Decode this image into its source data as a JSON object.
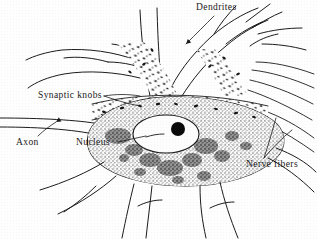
{
  "figure": {
    "background_color": "#fefefe",
    "ink_color": "#1a1a1a"
  },
  "labels": [
    {
      "id": "dendrites",
      "text": "Dendrites",
      "x": 196,
      "y": 3,
      "leader": "down-left to dendrite branches"
    },
    {
      "id": "synaptic_knobs",
      "text": "Synaptic knobs",
      "x": 38,
      "y": 91,
      "leader": "right to knob cluster"
    },
    {
      "id": "axon",
      "text": "Axon",
      "x": 16,
      "y": 138,
      "leader": "up-right to axon tube"
    },
    {
      "id": "nucleus",
      "text": "Nucleus",
      "x": 76,
      "y": 138,
      "leader": "right to cell nucleus"
    },
    {
      "id": "nerve_fibers",
      "text": "Nerve fibers",
      "x": 246,
      "y": 160,
      "leader": "up two-pronged to fibers"
    }
  ],
  "structures": {
    "cell_body": "large stippled soma centered at (185,145)",
    "nucleus": "pale oval with dark round nucleolus",
    "nucleolus": "solid black disc",
    "dendrites_count": 7,
    "axon": "narrow tube exiting frame at left",
    "nerve_fibers": "fine lines exiting frame at right",
    "synaptic_knobs": "small dark teardrop marks on dendrites and soma"
  }
}
